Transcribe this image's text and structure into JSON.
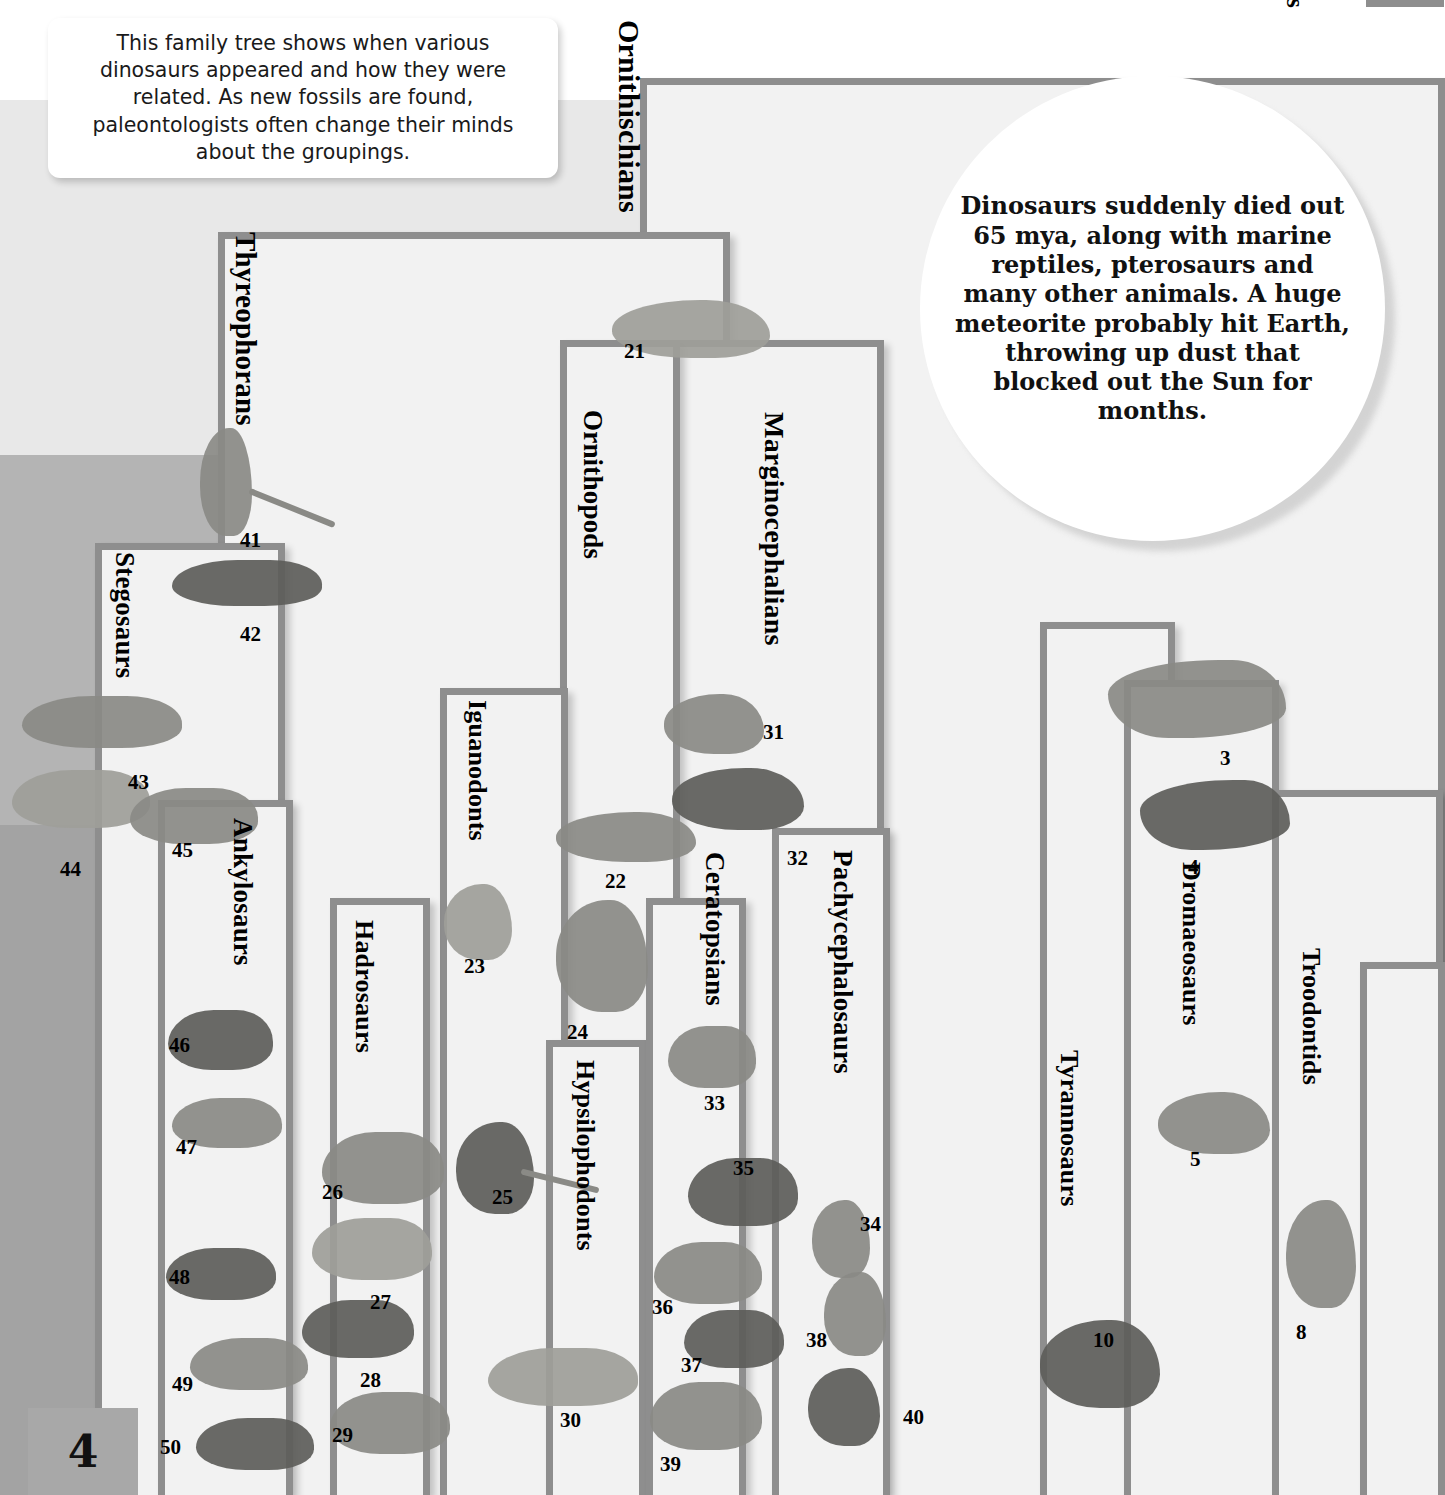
{
  "page": {
    "number": "4",
    "cut_off_glyph": "s"
  },
  "intro": {
    "text": "This family tree shows when various dinosaurs appeared and how they were related. As new fossils are found, paleontologists often change their minds about the groupings."
  },
  "callout": {
    "text": "Dinosaurs suddenly died out 65 mya, along with marine reptiles, pterosaurs and many other animals. A huge meteorite probably hit Earth, throwing up dust that blocked out the Sun for months."
  },
  "clades": [
    {
      "id": "ornithischians",
      "label": "Ornithischians"
    },
    {
      "id": "thyreophorans",
      "label": "Thyreophorans"
    },
    {
      "id": "stegosaurs",
      "label": "Stegosaurs"
    },
    {
      "id": "ankylosaurs",
      "label": "Ankylosaurs"
    },
    {
      "id": "hadrosaurs",
      "label": "Hadrosaurs"
    },
    {
      "id": "iguanodonts",
      "label": "Iguanodonts"
    },
    {
      "id": "ornithopods",
      "label": "Ornithopods"
    },
    {
      "id": "hypsilophodonts",
      "label": "Hypsilophodonts"
    },
    {
      "id": "marginocephalians",
      "label": "Marginocephalians"
    },
    {
      "id": "ceratopsians",
      "label": "Ceratopsians"
    },
    {
      "id": "pachycephalosaurs",
      "label": "Pachycephalosaurs"
    },
    {
      "id": "tyrannosaurs",
      "label": "Tyrannosaurs"
    },
    {
      "id": "dromaeosaurs",
      "label": "Dromaeosaurs"
    },
    {
      "id": "troodontids",
      "label": "Troodontids"
    }
  ],
  "specimens": [
    {
      "number": "3",
      "clade": "dromaeosaurs"
    },
    {
      "number": "4",
      "clade": "dromaeosaurs"
    },
    {
      "number": "5",
      "clade": "dromaeosaurs"
    },
    {
      "number": "8",
      "clade": "troodontids"
    },
    {
      "number": "10",
      "clade": "tyrannosaurs"
    },
    {
      "number": "21",
      "clade": "ornithischians"
    },
    {
      "number": "22",
      "clade": "ornithopods"
    },
    {
      "number": "23",
      "clade": "iguanodonts"
    },
    {
      "number": "24",
      "clade": "ornithopods"
    },
    {
      "number": "25",
      "clade": "iguanodonts"
    },
    {
      "number": "26",
      "clade": "hadrosaurs"
    },
    {
      "number": "27",
      "clade": "hadrosaurs"
    },
    {
      "number": "28",
      "clade": "hadrosaurs"
    },
    {
      "number": "29",
      "clade": "hadrosaurs"
    },
    {
      "number": "30",
      "clade": "hypsilophodonts"
    },
    {
      "number": "31",
      "clade": "marginocephalians"
    },
    {
      "number": "32",
      "clade": "marginocephalians"
    },
    {
      "number": "33",
      "clade": "ceratopsians"
    },
    {
      "number": "34",
      "clade": "pachycephalosaurs"
    },
    {
      "number": "35",
      "clade": "ceratopsians"
    },
    {
      "number": "36",
      "clade": "ceratopsians"
    },
    {
      "number": "37",
      "clade": "ceratopsians"
    },
    {
      "number": "38",
      "clade": "pachycephalosaurs"
    },
    {
      "number": "39",
      "clade": "ceratopsians"
    },
    {
      "number": "40",
      "clade": "pachycephalosaurs"
    },
    {
      "number": "41",
      "clade": "thyreophorans"
    },
    {
      "number": "42",
      "clade": "thyreophorans"
    },
    {
      "number": "43",
      "clade": "stegosaurs"
    },
    {
      "number": "44",
      "clade": "stegosaurs"
    },
    {
      "number": "45",
      "clade": "stegosaurs"
    },
    {
      "number": "46",
      "clade": "ankylosaurs"
    },
    {
      "number": "47",
      "clade": "ankylosaurs"
    },
    {
      "number": "48",
      "clade": "ankylosaurs"
    },
    {
      "number": "49",
      "clade": "ankylosaurs"
    },
    {
      "number": "50",
      "clade": "ankylosaurs"
    }
  ],
  "colors": {
    "band_top": "#ffffff",
    "band_upper": "#e8e8e8",
    "band_mid": "#b4b4b4",
    "band_lower": "#a3a3a3",
    "bracket_fill": "#f2f2f2",
    "bracket_border": "#8e8e8e",
    "page_box": "#a8a8a8"
  }
}
